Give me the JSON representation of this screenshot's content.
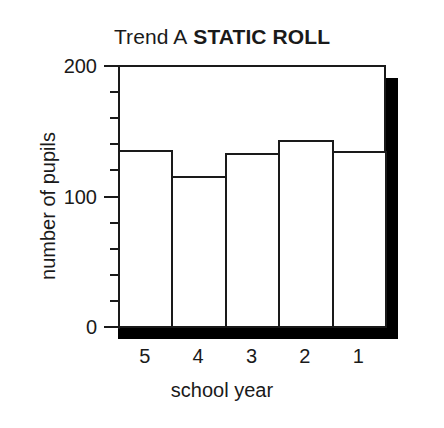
{
  "chart_data": {
    "type": "bar",
    "title_parts": {
      "regular": "Trend A",
      "bold": "STATIC ROLL"
    },
    "xlabel": "school year",
    "ylabel": "number of pupils",
    "categories": [
      "5",
      "4",
      "3",
      "2",
      "1"
    ],
    "values": [
      136,
      116,
      133,
      143,
      135
    ],
    "ylim": [
      0,
      200
    ],
    "y_major_ticks": [
      "0",
      "100",
      "200"
    ],
    "y_major_tick_values": [
      0,
      100,
      200
    ],
    "y_minor_tick_interval": 20,
    "grid": false,
    "legend": null,
    "bar_style": {
      "fill": "#ffffff",
      "edge": "#1a1a1a",
      "gap": 0
    },
    "shadow_color": "#000000"
  }
}
